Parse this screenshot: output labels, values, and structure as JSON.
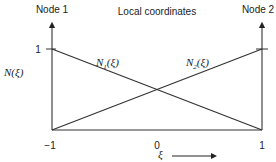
{
  "diagram": {
    "title": "Local coordinates",
    "node_left_label": "Node 1",
    "node_right_label": "Node 2",
    "y_axis_label": "N(ξ)",
    "x_axis_label": "ξ",
    "y_tick_one": "1",
    "x_ticks": [
      "−1",
      "0",
      "1"
    ],
    "curves": [
      {
        "name": "N",
        "subscript": "1",
        "arg": "(ξ)",
        "from_value": 1,
        "to_value": 0
      },
      {
        "name": "N",
        "subscript": "2",
        "arg": "(ξ)",
        "from_value": 0,
        "to_value": 1
      }
    ],
    "x_range": [
      -1,
      1
    ],
    "y_range": [
      0,
      1
    ],
    "line_color": "#333333"
  }
}
